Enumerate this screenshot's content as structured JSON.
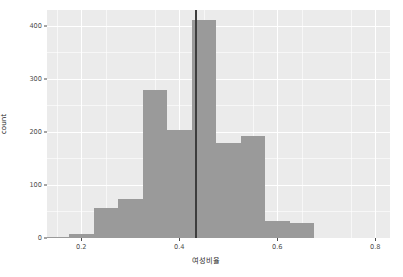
{
  "chart_data": {
    "type": "bar",
    "title": "",
    "subtitle": "",
    "xlabel": "여성비율",
    "ylabel": "count",
    "xlim": [
      0.13,
      0.83
    ],
    "ylim": [
      0,
      430
    ],
    "grid": true,
    "legend": null,
    "bin_width": 0.05,
    "x_ticks": [
      "0.2",
      "0.4",
      "0.6",
      "0.8"
    ],
    "x_tick_values": [
      0.2,
      0.4,
      0.6,
      0.8
    ],
    "y_ticks": [
      "0",
      "100",
      "200",
      "300",
      "400"
    ],
    "y_tick_values": [
      0,
      100,
      200,
      300,
      400
    ],
    "categories": [
      "0.150",
      "0.175",
      "0.225",
      "0.275",
      "0.325",
      "0.375",
      "0.425",
      "0.475",
      "0.525",
      "0.575",
      "0.625",
      "0.675"
    ],
    "bin_starts": [
      0.125,
      0.175,
      0.225,
      0.275,
      0.325,
      0.375,
      0.425,
      0.475,
      0.525,
      0.575,
      0.625,
      0.675
    ],
    "values": [
      2,
      8,
      57,
      74,
      280,
      203,
      412,
      179,
      193,
      33,
      29,
      0
    ],
    "annotations": [
      {
        "type": "vertical-line",
        "x": 0.433,
        "color": "#3d3d3d"
      }
    ],
    "colors": {
      "bar": "#9a9a9a",
      "panel": "#ebebeb",
      "grid": "#ffffff",
      "reference_line": "#3d3d3d",
      "axis_text": "#4d4d4d",
      "axis_title": "#2b2b2b"
    }
  }
}
